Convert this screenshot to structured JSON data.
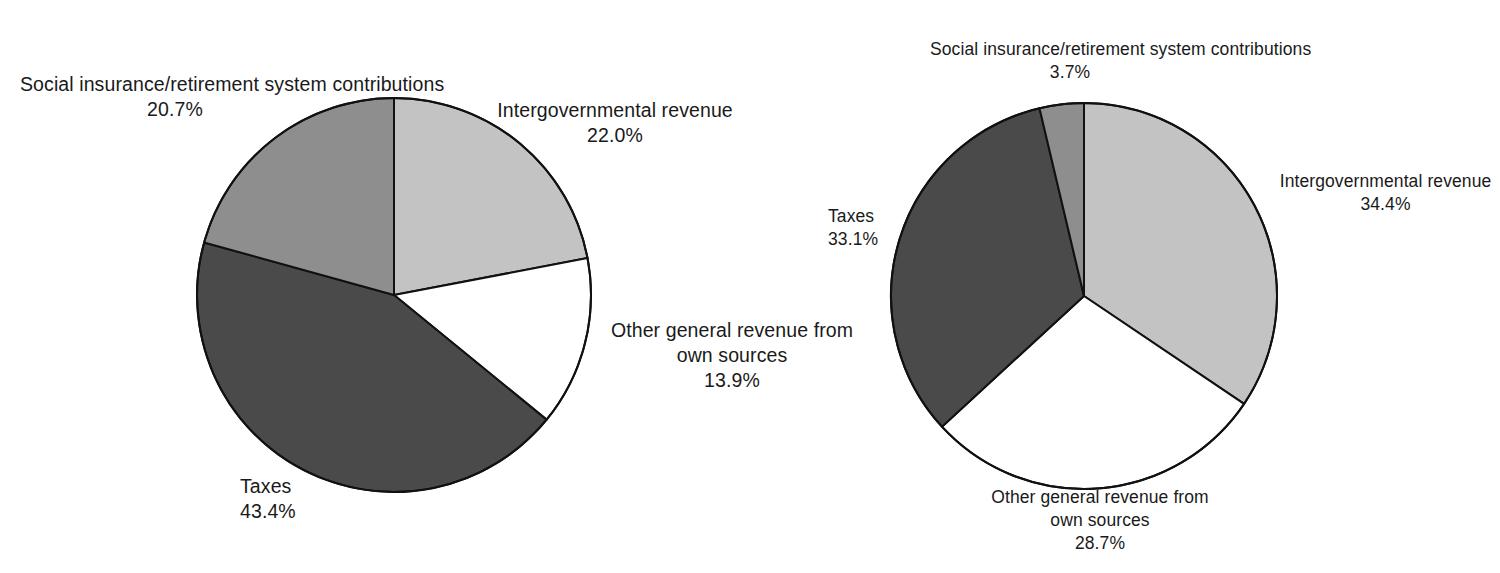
{
  "chart_data": [
    {
      "type": "pie",
      "title": "",
      "id": "left-pie",
      "start_angle_deg": 0,
      "direction": "clockwise",
      "center": {
        "x": 394,
        "y": 295
      },
      "radius": 197,
      "categories": [
        "Intergovernmental revenue",
        "Other general revenue from own sources",
        "Taxes",
        "Social insurance/retirement system contributions"
      ],
      "values": [
        22.0,
        13.9,
        43.4,
        20.7
      ],
      "labels": [
        "22.0%",
        "13.9%",
        "43.4%",
        "20.7%"
      ],
      "colors": [
        "#c3c3c3",
        "#ffffff",
        "#4a4a4a",
        "#8e8e8e"
      ],
      "slices": [
        {
          "name": "Intergovernmental revenue",
          "value": 22.0,
          "label": "22.0%",
          "color": "#c3c3c3"
        },
        {
          "name": "Other general revenue from own sources",
          "value": 13.9,
          "label": "13.9%",
          "color": "#ffffff"
        },
        {
          "name": "Taxes",
          "value": 43.4,
          "label": "43.4%",
          "color": "#4a4a4a"
        },
        {
          "name": "Social insurance/retirement system contributions",
          "value": 20.7,
          "label": "20.7%",
          "color": "#8e8e8e"
        }
      ],
      "legend": "none",
      "grid": false
    },
    {
      "type": "pie",
      "title": "",
      "id": "right-pie",
      "start_angle_deg": 0,
      "direction": "clockwise",
      "center": {
        "x": 284,
        "y": 296
      },
      "radius": 193,
      "categories": [
        "Intergovernmental revenue",
        "Other general revenue from own sources",
        "Taxes",
        "Social insurance/retirement system contributions"
      ],
      "values": [
        34.4,
        28.7,
        33.1,
        3.7
      ],
      "labels": [
        "34.4%",
        "28.7%",
        "33.1%",
        "3.7%"
      ],
      "colors": [
        "#c3c3c3",
        "#ffffff",
        "#4a4a4a",
        "#8e8e8e"
      ],
      "slices": [
        {
          "name": "Intergovernmental revenue",
          "value": 34.4,
          "label": "34.4%",
          "color": "#c3c3c3"
        },
        {
          "name": "Other general revenue from own sources",
          "value": 28.7,
          "label": "28.7%",
          "color": "#ffffff"
        },
        {
          "name": "Taxes",
          "value": 33.1,
          "label": "33.1%",
          "color": "#4a4a4a"
        },
        {
          "name": "Social insurance/retirement system contributions",
          "value": 3.7,
          "label": "3.7%",
          "color": "#8e8e8e"
        }
      ],
      "legend": "none",
      "grid": false
    }
  ],
  "left_chart": {
    "social": {
      "line1": "Social insurance/retirement",
      "line2": "system contributions",
      "pct": "20.7%"
    },
    "intergovernmental": {
      "line1": "Intergovernmental revenue",
      "pct": "22.0%"
    },
    "other": {
      "line1": "Other general revenue from",
      "line2": "own sources",
      "pct": "13.9%"
    },
    "taxes": {
      "line1": "Taxes",
      "pct": "43.4%"
    }
  },
  "right_chart": {
    "social": {
      "line1": "Social insurance/retirement",
      "line2": "system contributions",
      "pct": "3.7%"
    },
    "intergovernmental": {
      "line1": "Intergovernmental revenue",
      "pct": "34.4%"
    },
    "other": {
      "line1": "Other general revenue from",
      "line2": "own sources",
      "pct": "28.7%"
    },
    "taxes": {
      "line1": "Taxes",
      "pct": "33.1%"
    }
  },
  "style": {
    "outline": "#111111",
    "background": "#ffffff"
  }
}
